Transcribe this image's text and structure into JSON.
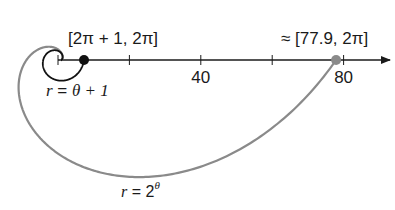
{
  "diagram": {
    "axis": {
      "origin_px": [
        58,
        60
      ],
      "px_per_unit": 3.57,
      "end_px": 390,
      "ticks": [
        0,
        20,
        40,
        60,
        80
      ],
      "tick_labels": [
        {
          "value": 40,
          "text": "40"
        },
        {
          "value": 80,
          "text": "80"
        }
      ],
      "color": "#1a1a1a"
    },
    "curves": [
      {
        "name": "linear-spiral",
        "equation_label": "r = θ + 1",
        "label_parts": {
          "lhs": "r",
          "eq": " = ",
          "rhs": "θ + 1"
        },
        "theta_max": 6.2832,
        "color": "#111111",
        "endpoint_label": "[2π + 1, 2π]",
        "endpoint_r": 7.283,
        "endpoint_color": "#111111"
      },
      {
        "name": "exponential-spiral",
        "equation_label": "r = 2^θ",
        "label_parts": {
          "lhs": "r",
          "eq": " = 2",
          "sup": "θ"
        },
        "theta_max": 6.2832,
        "color": "#8a8a8a",
        "endpoint_label": "≈ [77.9, 2π]",
        "endpoint_r": 77.9,
        "endpoint_color": "#8a8a8a"
      }
    ]
  }
}
